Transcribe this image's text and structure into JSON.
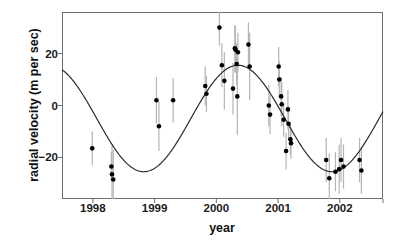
{
  "chart_data": {
    "type": "scatter",
    "title": "",
    "xlabel": "year",
    "ylabel": "radial velocity (m per sec)",
    "xlim": [
      1997.5,
      2002.7
    ],
    "ylim": [
      -36,
      36
    ],
    "xticks": [
      1998,
      1999,
      2000,
      2001,
      2002
    ],
    "xticklabels": [
      "1998",
      "1999",
      "2000",
      "2001",
      "2002"
    ],
    "yticks": [
      20,
      0,
      -20
    ],
    "yticklabels": [
      "20",
      "0",
      "-20"
    ],
    "grid": false,
    "legend": null,
    "marker": {
      "shape": "circle",
      "color": "#000000",
      "size_px": 4.6
    },
    "errorbar": {
      "color": "#b4b4b4",
      "width_px": 1.2,
      "style": "vertical-line"
    },
    "fit_curve": {
      "style": "sinusoid",
      "color": "#2b2b2b",
      "width_px": 1.2,
      "amplitude": 20.5,
      "offset": -5.0,
      "period_years": 3.05,
      "phase_peak_year": 2000.35,
      "description": "smooth sinusoidal radial-velocity fit, minimum near 1998.3 and 2001.9, maximum near 2000.35"
    },
    "points": [
      {
        "x": 1997.99,
        "y": -16.5,
        "yerr": 6.5
      },
      {
        "x": 1998.3,
        "y": -23.5,
        "yerr": 5.5
      },
      {
        "x": 1998.31,
        "y": -26.5,
        "yerr": 11.0
      },
      {
        "x": 1998.33,
        "y": -28.5,
        "yerr": 11.5
      },
      {
        "x": 1999.03,
        "y": 2.0,
        "yerr": 9.0
      },
      {
        "x": 1999.07,
        "y": -8.0,
        "yerr": 9.5
      },
      {
        "x": 1999.3,
        "y": 2.0,
        "yerr": 8.5
      },
      {
        "x": 1999.82,
        "y": 7.5,
        "yerr": 7.5
      },
      {
        "x": 1999.84,
        "y": 4.5,
        "yerr": 7.0
      },
      {
        "x": 2000.05,
        "y": 30.0,
        "yerr": 7.0
      },
      {
        "x": 2000.09,
        "y": 15.5,
        "yerr": 8.5
      },
      {
        "x": 2000.13,
        "y": 9.5,
        "yerr": 11.0
      },
      {
        "x": 2000.3,
        "y": 22.0,
        "yerr": 9.0
      },
      {
        "x": 2000.31,
        "y": 21.5,
        "yerr": 9.0
      },
      {
        "x": 2000.35,
        "y": 20.5,
        "yerr": 7.5
      },
      {
        "x": 2000.33,
        "y": 16.0,
        "yerr": 8.0
      },
      {
        "x": 2000.27,
        "y": 6.5,
        "yerr": 10.0
      },
      {
        "x": 2000.34,
        "y": 3.5,
        "yerr": 15.0
      },
      {
        "x": 2000.52,
        "y": 23.5,
        "yerr": 8.5
      },
      {
        "x": 2000.54,
        "y": 15.0,
        "yerr": 13.0
      },
      {
        "x": 2000.85,
        "y": 0.0,
        "yerr": 8.0
      },
      {
        "x": 2000.87,
        "y": -3.5,
        "yerr": 7.5
      },
      {
        "x": 2001.01,
        "y": 15.0,
        "yerr": 7.5
      },
      {
        "x": 2001.02,
        "y": 10.0,
        "yerr": 7.0
      },
      {
        "x": 2001.05,
        "y": 3.5,
        "yerr": 7.5
      },
      {
        "x": 2001.06,
        "y": 0.5,
        "yerr": 8.5
      },
      {
        "x": 2001.09,
        "y": -5.5,
        "yerr": 6.5
      },
      {
        "x": 2001.16,
        "y": -1.5,
        "yerr": 7.5
      },
      {
        "x": 2001.17,
        "y": -7.0,
        "yerr": 6.5
      },
      {
        "x": 2001.2,
        "y": -13.0,
        "yerr": 6.0
      },
      {
        "x": 2001.21,
        "y": -14.5,
        "yerr": 6.0
      },
      {
        "x": 2001.13,
        "y": -17.5,
        "yerr": 7.0
      },
      {
        "x": 2001.78,
        "y": -21.0,
        "yerr": 8.5
      },
      {
        "x": 2001.83,
        "y": -28.0,
        "yerr": 9.5
      },
      {
        "x": 2001.93,
        "y": -25.5,
        "yerr": 7.5
      },
      {
        "x": 2001.99,
        "y": -24.5,
        "yerr": 9.5
      },
      {
        "x": 2002.02,
        "y": -21.0,
        "yerr": 8.5
      },
      {
        "x": 2002.06,
        "y": -23.5,
        "yerr": 8.5
      },
      {
        "x": 2002.32,
        "y": -21.0,
        "yerr": 8.5
      },
      {
        "x": 2002.35,
        "y": -25.0,
        "yerr": 9.0
      }
    ]
  }
}
